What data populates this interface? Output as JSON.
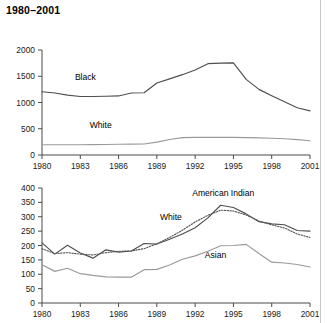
{
  "title": "1980–2001",
  "chart_data": [
    {
      "type": "line",
      "id": "top",
      "title": "",
      "xlabel": "",
      "ylabel": "",
      "x": [
        1980,
        1981,
        1982,
        1983,
        1984,
        1985,
        1986,
        1987,
        1988,
        1989,
        1990,
        1991,
        1992,
        1993,
        1994,
        1995,
        1996,
        1997,
        1998,
        1999,
        2000,
        2001
      ],
      "xlim": [
        1980,
        2001
      ],
      "ylim": [
        0,
        2000
      ],
      "xticks": [
        1980,
        1983,
        1986,
        1989,
        1992,
        1995,
        1998,
        2001
      ],
      "yticks": [
        0,
        500,
        1000,
        1500,
        2000
      ],
      "grid": false,
      "legend": "inline-labels",
      "series": [
        {
          "name": "Black",
          "style": "solid-dark",
          "label_x": 1983.4,
          "label_y": 1430,
          "values": [
            1205,
            1180,
            1140,
            1115,
            1115,
            1120,
            1125,
            1180,
            1185,
            1370,
            1450,
            1530,
            1620,
            1740,
            1750,
            1755,
            1440,
            1250,
            1130,
            1015,
            900,
            840
          ]
        },
        {
          "name": "White",
          "style": "solid-light",
          "label_x": 1984.6,
          "label_y": 510,
          "values": [
            195,
            195,
            195,
            195,
            198,
            200,
            205,
            208,
            210,
            245,
            295,
            330,
            335,
            335,
            335,
            335,
            330,
            325,
            320,
            310,
            292,
            272
          ]
        }
      ]
    },
    {
      "type": "line",
      "id": "bottom",
      "title": "",
      "xlabel": "",
      "ylabel": "",
      "x": [
        1980,
        1981,
        1982,
        1983,
        1984,
        1985,
        1986,
        1987,
        1988,
        1989,
        1990,
        1991,
        1992,
        1993,
        1994,
        1995,
        1996,
        1997,
        1998,
        1999,
        2000,
        2001
      ],
      "xlim": [
        1980,
        2001
      ],
      "ylim": [
        0,
        400
      ],
      "xticks": [
        1980,
        1983,
        1986,
        1989,
        1992,
        1995,
        1998,
        2001
      ],
      "yticks": [
        0,
        50,
        100,
        150,
        200,
        250,
        300,
        350,
        400
      ],
      "grid": false,
      "legend": "inline-labels",
      "series": [
        {
          "name": "American Indian",
          "style": "solid-dark",
          "label_x": 1994.2,
          "label_y": 372,
          "values": [
            209,
            170,
            201,
            174,
            156,
            185,
            177,
            181,
            207,
            205,
            222,
            240,
            262,
            296,
            340,
            332,
            310,
            283,
            275,
            272,
            252,
            250
          ]
        },
        {
          "name": "White",
          "style": "dotted",
          "label_x": 1990.1,
          "label_y": 290,
          "values": [
            189,
            172,
            175,
            170,
            167,
            175,
            180,
            181,
            189,
            206,
            228,
            253,
            282,
            305,
            323,
            320,
            306,
            285,
            272,
            261,
            240,
            228
          ]
        },
        {
          "name": "Asian",
          "style": "solid-light",
          "label_x": 1993.6,
          "label_y": 158,
          "values": [
            133,
            110,
            121,
            102,
            96,
            91,
            90,
            90,
            116,
            117,
            132,
            152,
            164,
            180,
            199,
            200,
            204,
            172,
            142,
            139,
            134,
            125
          ]
        }
      ]
    }
  ]
}
